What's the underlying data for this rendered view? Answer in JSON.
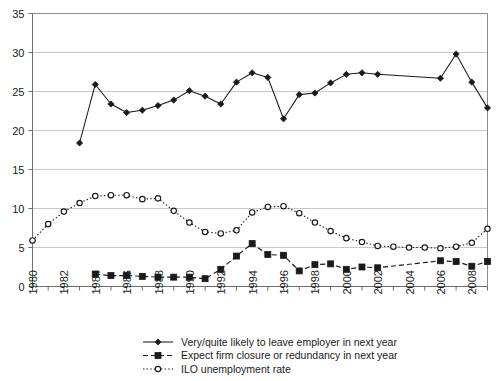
{
  "chart_data": {
    "type": "line",
    "title": "",
    "xlabel": "",
    "ylabel": "",
    "ylim": [
      0,
      35
    ],
    "ytick_step": 5,
    "yticks": [
      "0",
      "5",
      "10",
      "15",
      "20",
      "25",
      "30",
      "35"
    ],
    "grid": "horizontal",
    "legend_position": "bottom",
    "x": [
      1980,
      1981,
      1982,
      1983,
      1984,
      1985,
      1986,
      1987,
      1988,
      1989,
      1990,
      1991,
      1992,
      1993,
      1994,
      1995,
      1996,
      1997,
      1998,
      1999,
      2000,
      2001,
      2002,
      2003,
      2004,
      2005,
      2006,
      2007,
      2008,
      2009
    ],
    "xtick_labels": [
      "1980",
      "1982",
      "1984",
      "1986",
      "1988",
      "1990",
      "1992",
      "1994",
      "1996",
      "1998",
      "2000",
      "2002",
      "2004",
      "2006",
      "2008"
    ],
    "series": [
      {
        "name": "Very/quite likely to leave employer in next year",
        "marker": "diamond",
        "line_style": "solid",
        "color": "#1a1a1a",
        "x": [
          1983,
          1984,
          1985,
          1986,
          1987,
          1988,
          1989,
          1990,
          1991,
          1992,
          1993,
          1994,
          1995,
          1996,
          1997,
          1998,
          1999,
          2000,
          2001,
          2002,
          2006,
          2007,
          2008,
          2009
        ],
        "values": [
          18.4,
          25.9,
          23.4,
          22.3,
          22.6,
          23.2,
          23.9,
          25.1,
          24.4,
          23.4,
          26.2,
          27.4,
          26.8,
          21.5,
          24.6,
          24.8,
          26.1,
          27.2,
          27.4,
          27.2,
          26.7,
          29.8,
          26.2,
          22.9
        ]
      },
      {
        "name": "Expect firm closure or redundancy in next year",
        "marker": "square",
        "line_style": "dashed",
        "color": "#1a1a1a",
        "x": [
          1984,
          1985,
          1986,
          1987,
          1988,
          1989,
          1990,
          1991,
          1992,
          1993,
          1994,
          1995,
          1996,
          1997,
          1998,
          1999,
          2000,
          2001,
          2002,
          2006,
          2007,
          2008,
          2009
        ],
        "values": [
          1.6,
          1.4,
          1.4,
          1.3,
          1.2,
          1.2,
          1.2,
          1.0,
          2.2,
          3.9,
          5.5,
          4.1,
          4.0,
          2.0,
          2.8,
          2.9,
          2.2,
          2.5,
          2.4,
          3.3,
          3.2,
          2.6,
          3.2
        ]
      },
      {
        "name": "ILO unemployment rate",
        "marker": "open-circle",
        "line_style": "dotted",
        "color": "#1a1a1a",
        "x": [
          1980,
          1981,
          1982,
          1983,
          1984,
          1985,
          1986,
          1987,
          1988,
          1989,
          1990,
          1991,
          1992,
          1993,
          1994,
          1995,
          1996,
          1997,
          1998,
          1999,
          2000,
          2001,
          2002,
          2003,
          2004,
          2005,
          2006,
          2007,
          2008,
          2009
        ],
        "values": [
          5.9,
          8.0,
          9.6,
          10.7,
          11.6,
          11.7,
          11.7,
          11.2,
          11.3,
          9.7,
          8.2,
          7.0,
          6.8,
          7.2,
          9.5,
          10.2,
          10.3,
          9.4,
          8.2,
          7.1,
          6.2,
          5.7,
          5.2,
          5.1,
          5.0,
          5.0,
          4.9,
          5.1,
          5.6,
          7.4
        ]
      }
    ]
  },
  "legend": {
    "items": [
      {
        "label": "Very/quite likely to leave employer in next year",
        "marker": "diamond",
        "style": "solid"
      },
      {
        "label": "Expect firm closure or redundancy in next year",
        "marker": "square",
        "style": "dashed"
      },
      {
        "label": "ILO unemployment rate",
        "marker": "open-circle",
        "style": "dotted"
      }
    ]
  },
  "axes": {
    "y_min_label": "0",
    "y_max_label": "35"
  },
  "colors": {
    "series": "#1a1a1a",
    "grid": "#c9c9c9",
    "border": "#8a8a8a",
    "background": "#ffffff"
  }
}
